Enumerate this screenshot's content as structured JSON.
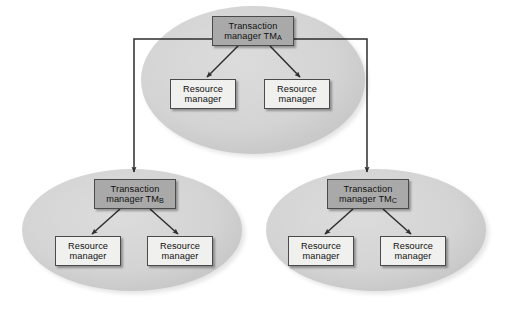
{
  "figure": {
    "background_color": "#ffffff",
    "ellipse_fill": "#d5d5d5",
    "tm_box_fill": "#a9a9a9",
    "rm_box_fill": "#f0f0ee",
    "line_color": "#2e2e2e"
  },
  "groups": [
    {
      "id": "group-a",
      "name": "top-transaction-scope",
      "transaction_manager": {
        "line1": "Transaction",
        "line2_prefix": "manager TM",
        "line2_subscript": "A",
        "full_label": "Transaction manager TMA"
      },
      "resource_managers": [
        {
          "line1": "Resource",
          "line2": "manager",
          "full_label": "Resource manager"
        },
        {
          "line1": "Resource",
          "line2": "manager",
          "full_label": "Resource manager"
        }
      ]
    },
    {
      "id": "group-b",
      "name": "bottom-left-transaction-scope",
      "transaction_manager": {
        "line1": "Transaction",
        "line2_prefix": "manager TM",
        "line2_subscript": "B",
        "full_label": "Transaction manager TMB"
      },
      "resource_managers": [
        {
          "line1": "Resource",
          "line2": "manager",
          "full_label": "Resource manager"
        },
        {
          "line1": "Resource",
          "line2": "manager",
          "full_label": "Resource manager"
        }
      ]
    },
    {
      "id": "group-c",
      "name": "bottom-right-transaction-scope",
      "transaction_manager": {
        "line1": "Transaction",
        "line2_prefix": "manager TM",
        "line2_subscript": "C",
        "full_label": "Transaction manager TMC"
      },
      "resource_managers": [
        {
          "line1": "Resource",
          "line2": "manager",
          "full_label": "Resource manager"
        },
        {
          "line1": "Resource",
          "line2": "manager",
          "full_label": "Resource manager"
        }
      ]
    }
  ],
  "connections": [
    {
      "from": "group-a.transaction_manager",
      "to": "group-a.resource_managers.0",
      "style": "arrow"
    },
    {
      "from": "group-a.transaction_manager",
      "to": "group-a.resource_managers.1",
      "style": "arrow"
    },
    {
      "from": "group-a.transaction_manager",
      "to": "group-b.transaction_manager",
      "style": "arrow-orthogonal-left"
    },
    {
      "from": "group-a.transaction_manager",
      "to": "group-c.transaction_manager",
      "style": "arrow-orthogonal-right"
    },
    {
      "from": "group-b.transaction_manager",
      "to": "group-b.resource_managers.0",
      "style": "arrow"
    },
    {
      "from": "group-b.transaction_manager",
      "to": "group-b.resource_managers.1",
      "style": "arrow"
    },
    {
      "from": "group-c.transaction_manager",
      "to": "group-c.resource_managers.0",
      "style": "arrow"
    },
    {
      "from": "group-c.transaction_manager",
      "to": "group-c.resource_managers.1",
      "style": "arrow"
    }
  ]
}
